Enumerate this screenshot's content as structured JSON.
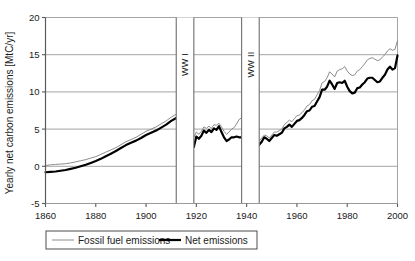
{
  "chart_data": {
    "type": "line",
    "title": "",
    "xlabel": "",
    "ylabel": "Yearly net carbon emissions [MtC/yr]",
    "xlim": [
      1860,
      2000
    ],
    "ylim": [
      -5,
      20
    ],
    "grid": true,
    "legend_position": "below-axes",
    "y_ticks": [
      "-5",
      "0",
      "5",
      "10",
      "15",
      "20"
    ],
    "y_tick_values": [
      -5,
      0,
      5,
      10,
      15,
      20
    ],
    "x_ticks": [
      "1860",
      "1880",
      "1900",
      "1920",
      "1940",
      "1960",
      "1980",
      "2000"
    ],
    "x_tick_values": [
      1860,
      1880,
      1900,
      1920,
      1940,
      1960,
      1980,
      2000
    ],
    "annotations": [
      {
        "label": "WW I",
        "x_start": 1912,
        "x_end": 1919,
        "orientation": "vertical"
      },
      {
        "label": "WW II",
        "x_start": 1938,
        "x_end": 1945,
        "orientation": "vertical"
      }
    ],
    "gaps": [
      [
        1912,
        1919
      ],
      [
        1938,
        1945
      ]
    ],
    "series": [
      {
        "name": "Fossil fuel emissions",
        "color": "#8c8c8c",
        "width": 1,
        "x": [
          1860,
          1862,
          1864,
          1866,
          1868,
          1870,
          1872,
          1874,
          1876,
          1878,
          1880,
          1882,
          1884,
          1886,
          1888,
          1890,
          1892,
          1894,
          1896,
          1898,
          1900,
          1902,
          1904,
          1906,
          1908,
          1910,
          1912,
          1919,
          1920,
          1921,
          1922,
          1923,
          1924,
          1925,
          1926,
          1927,
          1928,
          1929,
          1930,
          1931,
          1932,
          1933,
          1934,
          1935,
          1936,
          1937,
          1938,
          1945,
          1946,
          1947,
          1948,
          1949,
          1950,
          1951,
          1952,
          1953,
          1954,
          1955,
          1956,
          1957,
          1958,
          1959,
          1960,
          1961,
          1962,
          1963,
          1964,
          1965,
          1966,
          1967,
          1968,
          1969,
          1970,
          1971,
          1972,
          1973,
          1974,
          1975,
          1976,
          1977,
          1978,
          1979,
          1980,
          1981,
          1982,
          1983,
          1984,
          1985,
          1986,
          1987,
          1988,
          1989,
          1990,
          1991,
          1992,
          1993,
          1994,
          1995,
          1996,
          1997,
          1998,
          1999,
          2000
        ],
        "y": [
          0.1,
          0.2,
          0.25,
          0.3,
          0.35,
          0.45,
          0.6,
          0.75,
          0.9,
          1.1,
          1.3,
          1.6,
          1.9,
          2.2,
          2.5,
          2.9,
          3.3,
          3.6,
          3.9,
          4.3,
          4.7,
          5.0,
          5.3,
          5.7,
          6.1,
          6.6,
          7.0,
          3.9,
          4.6,
          4.3,
          4.7,
          5.3,
          5.1,
          5.4,
          5.1,
          5.6,
          5.5,
          5.8,
          5.3,
          4.7,
          4.3,
          4.6,
          5.0,
          5.2,
          5.7,
          6.3,
          6.5,
          3.4,
          3.8,
          4.2,
          4.1,
          3.8,
          4.2,
          4.6,
          4.6,
          4.8,
          5.0,
          5.6,
          5.9,
          6.2,
          6.0,
          6.4,
          6.8,
          6.9,
          7.2,
          7.6,
          8.1,
          8.3,
          8.8,
          9.0,
          9.6,
          10.2,
          11.2,
          11.4,
          11.9,
          12.7,
          12.4,
          12.0,
          12.8,
          13.0,
          13.1,
          13.4,
          12.8,
          12.4,
          12.2,
          12.3,
          12.8,
          13.0,
          13.4,
          13.8,
          14.3,
          14.5,
          14.6,
          14.4,
          14.2,
          14.3,
          14.7,
          15.0,
          15.5,
          15.8,
          15.6,
          15.7,
          16.9
        ]
      },
      {
        "name": "Net emissions",
        "color": "#000000",
        "width": 2.2,
        "x": [
          1860,
          1862,
          1864,
          1866,
          1868,
          1870,
          1872,
          1874,
          1876,
          1878,
          1880,
          1882,
          1884,
          1886,
          1888,
          1890,
          1892,
          1894,
          1896,
          1898,
          1900,
          1902,
          1904,
          1906,
          1908,
          1910,
          1912,
          1919,
          1920,
          1921,
          1922,
          1923,
          1924,
          1925,
          1926,
          1927,
          1928,
          1929,
          1930,
          1931,
          1932,
          1933,
          1934,
          1935,
          1936,
          1937,
          1938,
          1945,
          1946,
          1947,
          1948,
          1949,
          1950,
          1951,
          1952,
          1953,
          1954,
          1955,
          1956,
          1957,
          1958,
          1959,
          1960,
          1961,
          1962,
          1963,
          1964,
          1965,
          1966,
          1967,
          1968,
          1969,
          1970,
          1971,
          1972,
          1973,
          1974,
          1975,
          1976,
          1977,
          1978,
          1979,
          1980,
          1981,
          1982,
          1983,
          1984,
          1985,
          1986,
          1987,
          1988,
          1989,
          1990,
          1991,
          1992,
          1993,
          1994,
          1995,
          1996,
          1997,
          1998,
          1999,
          2000
        ],
        "y": [
          -0.8,
          -0.75,
          -0.7,
          -0.6,
          -0.5,
          -0.35,
          -0.2,
          0.0,
          0.2,
          0.45,
          0.7,
          1.0,
          1.35,
          1.7,
          2.05,
          2.45,
          2.85,
          3.15,
          3.45,
          3.8,
          4.2,
          4.5,
          4.8,
          5.2,
          5.6,
          6.1,
          6.5,
          2.6,
          4.0,
          3.7,
          4.1,
          4.8,
          4.5,
          4.9,
          4.6,
          5.1,
          4.9,
          5.4,
          4.6,
          3.9,
          3.4,
          3.6,
          3.9,
          3.9,
          4.0,
          3.9,
          3.9,
          2.9,
          3.3,
          3.9,
          3.7,
          3.4,
          3.8,
          4.2,
          4.1,
          4.3,
          4.5,
          5.1,
          5.3,
          5.6,
          5.3,
          5.7,
          6.1,
          6.2,
          6.5,
          6.9,
          7.4,
          7.5,
          8.0,
          8.1,
          8.7,
          9.3,
          10.3,
          10.3,
          10.7,
          11.5,
          11.0,
          10.4,
          11.2,
          11.3,
          11.2,
          11.5,
          10.7,
          10.1,
          9.8,
          9.9,
          10.5,
          10.6,
          11.0,
          11.3,
          11.8,
          11.9,
          11.9,
          11.6,
          11.3,
          11.4,
          11.9,
          12.3,
          13.0,
          13.4,
          13.0,
          13.2,
          14.9
        ]
      }
    ]
  },
  "legend": {
    "items": [
      {
        "label": "Fossil fuel emissions",
        "marker": "thin-gray-line"
      },
      {
        "label": "Net emissions",
        "marker": "thick-black-line"
      }
    ]
  }
}
